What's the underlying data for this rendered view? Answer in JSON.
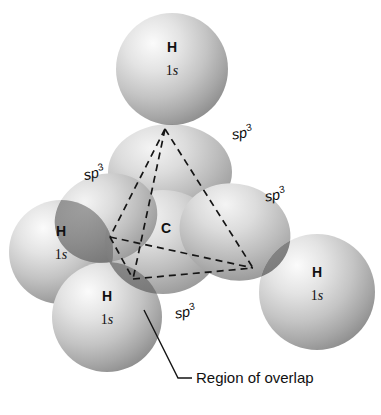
{
  "figure": {
    "background_color": "#ffffff",
    "width": 381,
    "height": 415
  },
  "colors": {
    "sphere_light": "#f2f2f2",
    "sphere_mid": "#b9b9b9",
    "sphere_dark": "#8c8c8c",
    "overlap_dark": "#6e6e6e",
    "lobe_light": "#ededed",
    "lobe_mid": "#c2c2c2",
    "lobe_dark": "#959595",
    "line_color": "#151515",
    "text_color": "#111111"
  },
  "central_atom": {
    "symbol": "C",
    "name": "carbon-center",
    "x": 166,
    "y": 228
  },
  "hydrogens": [
    {
      "id": "h-top",
      "symbol": "H",
      "shell_number": "1",
      "shell_letter": "s",
      "label_x": 172,
      "label_y": 52,
      "cx": 172,
      "cy": 69,
      "r": 56
    },
    {
      "id": "h-left",
      "symbol": "H",
      "shell_number": "1",
      "shell_letter": "s",
      "label_x": 61,
      "label_y": 236,
      "cx": 61,
      "cy": 252,
      "r": 52
    },
    {
      "id": "h-bottom-left",
      "symbol": "H",
      "shell_number": "1",
      "shell_letter": "s",
      "label_x": 107,
      "label_y": 301,
      "cx": 107,
      "cy": 317,
      "r": 55
    },
    {
      "id": "h-right",
      "symbol": "H",
      "shell_number": "1",
      "shell_letter": "s",
      "label_x": 317,
      "label_y": 277,
      "cx": 317,
      "cy": 292,
      "r": 58
    }
  ],
  "orbital_labels": [
    {
      "id": "sp3-top-right",
      "base": "sp",
      "superscript": "3",
      "x": 243,
      "y": 138
    },
    {
      "id": "sp3-left",
      "base": "sp",
      "superscript": "3",
      "x": 95,
      "y": 178
    },
    {
      "id": "sp3-right",
      "base": "sp",
      "superscript": "3",
      "x": 276,
      "y": 200
    },
    {
      "id": "sp3-bottom",
      "base": "sp",
      "superscript": "3",
      "x": 186,
      "y": 317
    }
  ],
  "tetrahedron": {
    "name": "tetrahedral-bond-framework",
    "style": "dashed",
    "apex": {
      "x": 165,
      "y": 129
    },
    "left": {
      "x": 110,
      "y": 237
    },
    "bottom": {
      "x": 133,
      "y": 279
    },
    "right": {
      "x": 253,
      "y": 268
    }
  },
  "callout": {
    "name": "region-of-overlap-callout",
    "text": "Region of overlap",
    "text_x": 196,
    "text_y": 383,
    "leader_start": {
      "x": 144,
      "y": 310
    },
    "leader_elbow": {
      "x": 178,
      "y": 378
    },
    "leader_end": {
      "x": 192,
      "y": 378
    }
  }
}
